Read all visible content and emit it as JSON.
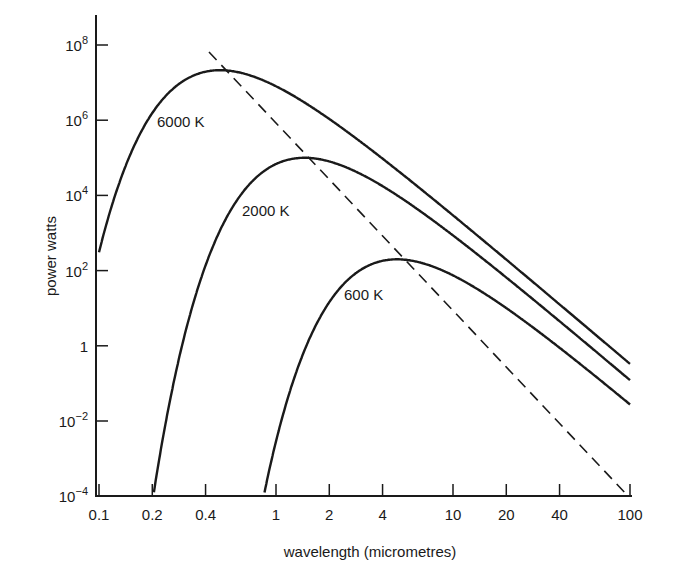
{
  "chart_data": {
    "type": "line",
    "title": "",
    "xlabel": "wavelength (micrometres)",
    "ylabel": "power watts",
    "x_scale": "log",
    "y_scale": "log",
    "xlim": [
      0.1,
      100
    ],
    "ylim": [
      0.0001,
      100000000
    ],
    "grid": false,
    "legend": "inline curve labels",
    "x_ticks": [
      {
        "value": 0.1,
        "label": "0.1"
      },
      {
        "value": 0.2,
        "label": "0.2"
      },
      {
        "value": 0.4,
        "label": "0.4"
      },
      {
        "value": 1,
        "label": "1"
      },
      {
        "value": 2,
        "label": "2"
      },
      {
        "value": 4,
        "label": "4"
      },
      {
        "value": 10,
        "label": "10"
      },
      {
        "value": 20,
        "label": "20"
      },
      {
        "value": 40,
        "label": "40"
      },
      {
        "value": 100,
        "label": "100"
      }
    ],
    "y_ticks": [
      {
        "exp": 8,
        "base": "10",
        "sup": "8"
      },
      {
        "exp": 6,
        "base": "10",
        "sup": "6"
      },
      {
        "exp": 4,
        "base": "10",
        "sup": "4"
      },
      {
        "exp": 2,
        "base": "10",
        "sup": "2"
      },
      {
        "exp": 0,
        "base": "1",
        "sup": ""
      },
      {
        "exp": -2,
        "base": "10",
        "sup": "−2"
      },
      {
        "exp": -4,
        "base": "10",
        "sup": "−4"
      }
    ],
    "series": [
      {
        "name": "6000 K",
        "temperature_K": 6000,
        "peak_wavelength": 0.5,
        "peak_power_log10": 7.33,
        "start": [
          0.1,
          300
        ],
        "end": [
          100,
          0.1
        ]
      },
      {
        "name": "2000 K",
        "temperature_K": 2000,
        "peak_wavelength": 1.5,
        "peak_power_log10": 5.0,
        "start": [
          0.2,
          0.0001
        ],
        "end": [
          100,
          0.03
        ]
      },
      {
        "name": "600 K",
        "temperature_K": 600,
        "peak_wavelength": 5.0,
        "peak_power_log10": 2.3,
        "start": [
          0.85,
          0.0001
        ],
        "end": [
          100,
          0.01
        ]
      }
    ],
    "annotations": [
      {
        "type": "dashed_line",
        "description": "Wien displacement locus through curve peaks",
        "from": [
          0.4,
          100000000
        ],
        "to": [
          100,
          0.0001
        ]
      }
    ]
  }
}
